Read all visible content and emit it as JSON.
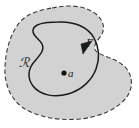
{
  "figure": {
    "type": "math-diagram",
    "background_color": "#ffffff",
    "region": {
      "label": "ℛ",
      "fill_color": "#d2d2d2",
      "boundary_style": "dashed",
      "boundary_color": "#3a3a3a"
    },
    "contour": {
      "label": "Γ",
      "stroke_color": "#1a1a1a",
      "style": "solid",
      "closed": true,
      "orientation": "counterclockwise",
      "arrow": "direction-arrowhead"
    },
    "point": {
      "label": "a",
      "marker": "filled-dot",
      "color": "#111111"
    }
  }
}
